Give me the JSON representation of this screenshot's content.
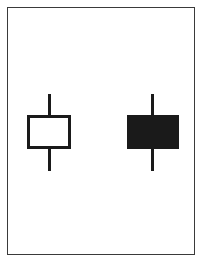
{
  "diagram": {
    "type": "candlestick-illustration",
    "colors": {
      "frame": "#3a3a3a",
      "stroke": "#1a1a1a",
      "hollow_fill": "#ffffff",
      "filled_fill": "#1a1a1a",
      "background": "#ffffff"
    },
    "candles": [
      {
        "name": "hollow-candle",
        "style": "hollow",
        "wick_x": 49,
        "wick_top": 94,
        "body_top": 115,
        "body_bottom": 149,
        "wick_bottom": 171,
        "body_left": 27,
        "body_right": 71
      },
      {
        "name": "filled-candle",
        "style": "filled",
        "wick_x": 152,
        "wick_top": 94,
        "body_top": 115,
        "body_bottom": 149,
        "wick_bottom": 171,
        "body_left": 127,
        "body_right": 179
      }
    ]
  }
}
